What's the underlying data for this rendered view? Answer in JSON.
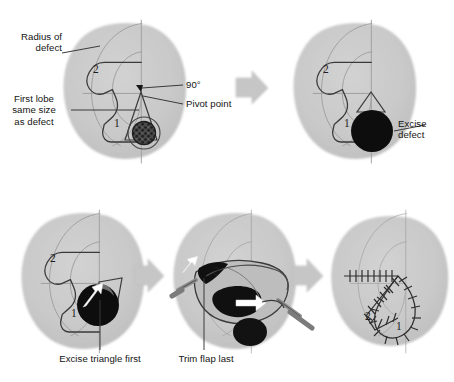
{
  "figure": {
    "type": "surgical-technique-diagram",
    "panel_count": 5,
    "rows": 2,
    "colors": {
      "skin": "#c9c9c9",
      "skin_shadow": "#bdbdbd",
      "outline": "#3c3c3c",
      "faint_line": "#a0a0a0",
      "defect_fill": "#0d0d0d",
      "arrow": "#c6c6c6",
      "arrow_edge": "#b3b3b3",
      "text": "#141414",
      "leader": "#3c3c3c",
      "instrument": "#8a8a8a",
      "white_arrow": "#ffffff",
      "background": "#ffffff"
    }
  },
  "labels": {
    "radius_of_defect": "Radius of\ndefect",
    "first_lobe_same_size": "First lobe\nsame size\nas defect",
    "angle_90": "90°",
    "pivot_point": "Pivot point",
    "excise_defect": "Excise\ndefect",
    "excise_triangle_first": "Excise triangle first",
    "trim_flap_last": "Trim flap last"
  },
  "lobe_markers": {
    "lobe_one": "1",
    "lobe_two": "2"
  },
  "panels": [
    {
      "id": "panel-1-design",
      "row": 1,
      "position": "top-left",
      "caption_labels": [
        "radius_of_defect",
        "first_lobe_same_size",
        "angle_90",
        "pivot_point"
      ],
      "markers": [
        "2",
        "1"
      ],
      "shows": "Flap design with arcs, pivot point and lesion marked"
    },
    {
      "id": "panel-2-excise-defect",
      "row": 1,
      "position": "top-right",
      "caption_labels": [
        "excise_defect"
      ],
      "markers": [
        "2",
        "1"
      ],
      "shows": "Circular defect excised, shown filled black"
    },
    {
      "id": "panel-3-excise-triangle",
      "row": 2,
      "position": "bottom-left",
      "caption_labels": [
        "excise_triangle_first"
      ],
      "markers": [
        "2",
        "1"
      ],
      "shows": "Standing cone triangle excision with rotation arrow"
    },
    {
      "id": "panel-4-trim-flap",
      "row": 2,
      "position": "bottom-center",
      "caption_labels": [
        "trim_flap_last"
      ],
      "markers": [
        "2"
      ],
      "shows": "Flap elevated and transposed with skin hooks and forceps"
    },
    {
      "id": "panel-5-closure",
      "row": 2,
      "position": "bottom-right",
      "caption_labels": [],
      "markers": [
        "2",
        "1"
      ],
      "shows": "Final suture line closure with hatch-mark sutures"
    }
  ],
  "arrows": [
    {
      "id": "arrow-1",
      "from": "panel-1-design",
      "to": "panel-2-excise-defect",
      "direction": "right"
    },
    {
      "id": "arrow-2",
      "from": "panel-3-excise-triangle",
      "to": "panel-4-trim-flap",
      "direction": "right"
    },
    {
      "id": "arrow-3",
      "from": "panel-4-trim-flap",
      "to": "panel-5-closure",
      "direction": "right"
    }
  ]
}
